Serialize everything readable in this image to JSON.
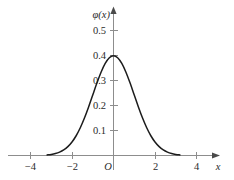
{
  "chart_data": {
    "type": "line",
    "title": "",
    "subtitle": "",
    "xlabel": "x",
    "ylabel": "φ(x)",
    "xlim": [
      -4.9,
      5.0
    ],
    "ylim": [
      0,
      0.56
    ],
    "grid": false,
    "legend": null,
    "origin_label": "O",
    "x_ticks": [
      -4,
      -2,
      2,
      4
    ],
    "x_tick_labels": [
      "−4",
      "−2",
      "2",
      "4"
    ],
    "y_ticks": [
      0.1,
      0.2,
      0.3,
      0.4,
      0.5
    ],
    "y_tick_labels": [
      "0.1",
      "0.2",
      "0.3",
      "0.4",
      "0.5"
    ],
    "series": [
      {
        "name": "standard normal density",
        "x": [
          -3.2,
          -3.0,
          -2.8,
          -2.6,
          -2.4,
          -2.2,
          -2.0,
          -1.8,
          -1.6,
          -1.4,
          -1.2,
          -1.0,
          -0.8,
          -0.6,
          -0.4,
          -0.2,
          0.0,
          0.2,
          0.4,
          0.6,
          0.8,
          1.0,
          1.2,
          1.4,
          1.6,
          1.8,
          2.0,
          2.2,
          2.4,
          2.6,
          2.8,
          3.0,
          3.2
        ],
        "values": [
          0.0024,
          0.0044,
          0.0079,
          0.0136,
          0.0224,
          0.0355,
          0.054,
          0.079,
          0.1109,
          0.1497,
          0.1942,
          0.242,
          0.2897,
          0.3332,
          0.3683,
          0.391,
          0.3989,
          0.391,
          0.3683,
          0.3332,
          0.2897,
          0.242,
          0.1942,
          0.1497,
          0.1109,
          0.079,
          0.054,
          0.0355,
          0.0224,
          0.0136,
          0.0079,
          0.0044,
          0.0024
        ]
      }
    ],
    "peak": {
      "x": 0.0,
      "y": 0.3989
    },
    "colors": {
      "curve": "#1c1c1c",
      "axis": "#8d8d8d",
      "text": "#2b2b2b",
      "background": "#ffffff"
    }
  }
}
